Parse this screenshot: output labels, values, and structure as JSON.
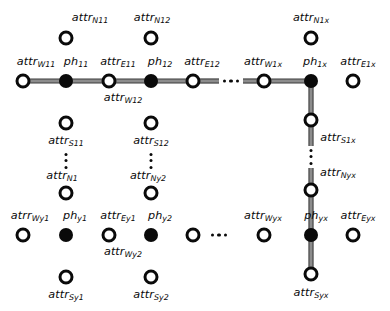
{
  "diagram": {
    "canvas": {
      "width": 390,
      "height": 311
    },
    "style": {
      "hollow_node_fill": "#ffffff",
      "node_stroke": "#0a0a0a",
      "filled_node_fill": "#0a0a0a",
      "edge_color": "#8c8c8c",
      "edge_outline": "#3a3a3a",
      "background": "#ffffff",
      "text_color": "#0a0a0a"
    },
    "legend_note": "Filled circles are ph (physical) nodes; hollow circles are attr (attribute) nodes.",
    "nodes": [
      {
        "id": "attr_W11",
        "base": "attr",
        "sub": "W11",
        "kind": "hollow",
        "x": 23,
        "y": 81,
        "label_x": 36,
        "label_y": 62,
        "label_align": "center"
      },
      {
        "id": "ph_11",
        "base": "ph",
        "sub": "11",
        "kind": "filled",
        "x": 66,
        "y": 81,
        "label_x": 76,
        "label_y": 62,
        "label_align": "center"
      },
      {
        "id": "attr_E11",
        "base": "attr",
        "sub": "E11",
        "kind": "hollow",
        "x": 109,
        "y": 81,
        "label_x": 118,
        "label_y": 62,
        "label_align": "center"
      },
      {
        "id": "attr_W12",
        "base": "attr",
        "sub": "W12",
        "kind": "hollow",
        "x": 109,
        "y": 81,
        "label_x": 123,
        "label_y": 98,
        "label_align": "center",
        "label_only": true
      },
      {
        "id": "ph_12",
        "base": "ph",
        "sub": "12",
        "kind": "filled",
        "x": 151,
        "y": 81,
        "label_x": 160,
        "label_y": 62,
        "label_align": "center"
      },
      {
        "id": "attr_E12",
        "base": "attr",
        "sub": "E12",
        "kind": "hollow",
        "x": 193,
        "y": 81,
        "label_x": 202,
        "label_y": 62,
        "label_align": "center"
      },
      {
        "id": "attr_W1x",
        "base": "attr",
        "sub": "W1x",
        "kind": "hollow",
        "x": 264,
        "y": 81,
        "label_x": 263,
        "label_y": 62,
        "label_align": "center"
      },
      {
        "id": "ph_1x",
        "base": "ph",
        "sub": "1x",
        "kind": "filled",
        "x": 311,
        "y": 81,
        "label_x": 315,
        "label_y": 62,
        "label_align": "center"
      },
      {
        "id": "attr_E1x",
        "base": "attr",
        "sub": "E1x",
        "kind": "hollow",
        "x": 353,
        "y": 81,
        "label_x": 358,
        "label_y": 62,
        "label_align": "center"
      },
      {
        "id": "attr_N11",
        "base": "attr",
        "sub": "N11",
        "kind": "hollow",
        "x": 66,
        "y": 38,
        "label_x": 90,
        "label_y": 18,
        "label_align": "center"
      },
      {
        "id": "attr_N12",
        "base": "attr",
        "sub": "N12",
        "kind": "hollow",
        "x": 151,
        "y": 38,
        "label_x": 152,
        "label_y": 18,
        "label_align": "center"
      },
      {
        "id": "attr_N1x",
        "base": "attr",
        "sub": "N1x",
        "kind": "hollow",
        "x": 311,
        "y": 38,
        "label_x": 311,
        "label_y": 18,
        "label_align": "center"
      },
      {
        "id": "attr_S11",
        "base": "attr",
        "sub": "S11",
        "kind": "hollow",
        "x": 66,
        "y": 123,
        "label_x": 66,
        "label_y": 141,
        "label_align": "center"
      },
      {
        "id": "attr_S12",
        "base": "attr",
        "sub": "S12",
        "kind": "hollow",
        "x": 151,
        "y": 123,
        "label_x": 151,
        "label_y": 141,
        "label_align": "center"
      },
      {
        "id": "attr_S1x",
        "base": "attr",
        "sub": "S1x",
        "kind": "hollow",
        "x": 311,
        "y": 120,
        "label_x": 338,
        "label_y": 138,
        "label_align": "center"
      },
      {
        "id": "attr_N1",
        "base": "attr",
        "sub": "N1",
        "kind": "hollow",
        "x": 66,
        "y": 193,
        "label_x": 62,
        "label_y": 176,
        "label_align": "center"
      },
      {
        "id": "attr_Ny2",
        "base": "attr",
        "sub": "Ny2",
        "kind": "hollow",
        "x": 151,
        "y": 193,
        "label_x": 148,
        "label_y": 176,
        "label_align": "center"
      },
      {
        "id": "attr_Nyx",
        "base": "attr",
        "sub": "Nyx",
        "kind": "hollow",
        "x": 311,
        "y": 190,
        "label_x": 338,
        "label_y": 173,
        "label_align": "center"
      },
      {
        "id": "atrr_Wy1",
        "base": "atrr",
        "sub": "Wy1",
        "kind": "hollow",
        "x": 23,
        "y": 235,
        "label_x": 30,
        "label_y": 216,
        "label_align": "center"
      },
      {
        "id": "ph_y1",
        "base": "ph",
        "sub": "y1",
        "kind": "filled",
        "x": 66,
        "y": 235,
        "label_x": 75,
        "label_y": 216,
        "label_align": "center"
      },
      {
        "id": "attr_Ey1",
        "base": "attr",
        "sub": "Ey1",
        "kind": "hollow",
        "x": 109,
        "y": 235,
        "label_x": 118,
        "label_y": 216,
        "label_align": "center"
      },
      {
        "id": "attr_Wy2",
        "base": "attr",
        "sub": "Wy2",
        "kind": "hollow",
        "x": 109,
        "y": 235,
        "label_x": 123,
        "label_y": 252,
        "label_align": "center",
        "label_only": true
      },
      {
        "id": "ph_y2",
        "base": "ph",
        "sub": "y2",
        "kind": "filled",
        "x": 151,
        "y": 235,
        "label_x": 160,
        "label_y": 216,
        "label_align": "center"
      },
      {
        "id": "attr_E_y2",
        "base": "attr",
        "sub": "",
        "kind": "hollow",
        "x": 193,
        "y": 235,
        "label_x": 0,
        "label_y": 0,
        "label_align": "center",
        "no_label": true
      },
      {
        "id": "attr_Wyx",
        "base": "attr",
        "sub": "Wyx",
        "kind": "hollow",
        "x": 264,
        "y": 235,
        "label_x": 263,
        "label_y": 216,
        "label_align": "center"
      },
      {
        "id": "ph_yx",
        "base": "ph",
        "sub": "yx",
        "kind": "filled",
        "x": 311,
        "y": 235,
        "label_x": 316,
        "label_y": 216,
        "label_align": "center"
      },
      {
        "id": "attr_Eyx",
        "base": "attr",
        "sub": "Eyx",
        "kind": "hollow",
        "x": 353,
        "y": 235,
        "label_x": 358,
        "label_y": 216,
        "label_align": "center"
      },
      {
        "id": "attr_Sy1",
        "base": "attr",
        "sub": "Sy1",
        "kind": "hollow",
        "x": 66,
        "y": 277,
        "label_x": 66,
        "label_y": 295,
        "label_align": "center"
      },
      {
        "id": "attr_Sy2",
        "base": "attr",
        "sub": "Sy2",
        "kind": "hollow",
        "x": 151,
        "y": 277,
        "label_x": 151,
        "label_y": 295,
        "label_align": "center"
      },
      {
        "id": "attr_Syx",
        "base": "attr",
        "sub": "Syx",
        "kind": "hollow",
        "x": 311,
        "y": 274,
        "label_x": 311,
        "label_y": 293,
        "label_align": "center"
      }
    ],
    "edges": [
      {
        "id": "e-w11-ph11",
        "x1": 23,
        "y1": 81,
        "x2": 66,
        "y2": 81
      },
      {
        "id": "e-ph11-e11",
        "x1": 66,
        "y1": 81,
        "x2": 109,
        "y2": 81
      },
      {
        "id": "e-e11-ph12",
        "x1": 109,
        "y1": 81,
        "x2": 151,
        "y2": 81
      },
      {
        "id": "e-ph12-e12",
        "x1": 151,
        "y1": 81,
        "x2": 193,
        "y2": 81
      },
      {
        "id": "e-e12-gap",
        "x1": 193,
        "y1": 81,
        "x2": 219,
        "y2": 81
      },
      {
        "id": "e-gap-w1x",
        "x1": 243,
        "y1": 81,
        "x2": 264,
        "y2": 81
      },
      {
        "id": "e-w1x-ph1x",
        "x1": 264,
        "y1": 81,
        "x2": 311,
        "y2": 81
      },
      {
        "id": "e-ph1x-s1x",
        "x1": 311,
        "y1": 81,
        "x2": 311,
        "y2": 120
      },
      {
        "id": "e-s1x-gap",
        "x1": 311,
        "y1": 120,
        "x2": 311,
        "y2": 146
      },
      {
        "id": "e-gap-nyx",
        "x1": 311,
        "y1": 168,
        "x2": 311,
        "y2": 190
      },
      {
        "id": "e-nyx-phyx",
        "x1": 311,
        "y1": 190,
        "x2": 311,
        "y2": 235
      },
      {
        "id": "e-phyx-syx",
        "x1": 311,
        "y1": 235,
        "x2": 311,
        "y2": 274
      }
    ],
    "ellipses": [
      {
        "id": "ell-top-row",
        "orient": "horiz",
        "x": 231,
        "y": 81,
        "dots": 3
      },
      {
        "id": "ell-bottom-row",
        "orient": "horiz",
        "x": 219,
        "y": 235,
        "dots": 3
      },
      {
        "id": "ell-col1",
        "orient": "vert",
        "x": 66,
        "y": 161,
        "dots": 3
      },
      {
        "id": "ell-col2",
        "orient": "vert",
        "x": 151,
        "y": 161,
        "dots": 3
      },
      {
        "id": "ell-colx",
        "orient": "vert",
        "x": 311,
        "y": 157,
        "dots": 3
      }
    ]
  }
}
